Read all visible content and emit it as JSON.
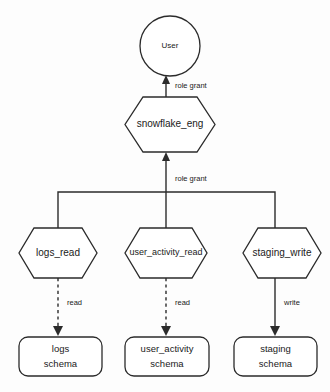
{
  "diagram": {
    "background_color": "#fdfdfd",
    "line_color": "#2b2b2b",
    "text_color": "#1a1a1a",
    "nodes": {
      "user": {
        "label": "User",
        "shape": "circle"
      },
      "snowflake_eng": {
        "label": "snowflake_eng",
        "shape": "hexagon"
      },
      "logs_read": {
        "label": "logs_read",
        "shape": "hexagon"
      },
      "user_activity_read": {
        "label": "user_activity_read",
        "shape": "hexagon"
      },
      "staging_write": {
        "label": "staging_write",
        "shape": "hexagon"
      },
      "logs_schema": {
        "label_line1": "logs",
        "label_line2": "schema",
        "shape": "rounded-rect"
      },
      "user_activity_schema": {
        "label_line1": "user_activity",
        "label_line2": "schema",
        "shape": "rounded-rect"
      },
      "staging_schema": {
        "label_line1": "staging",
        "label_line2": "schema",
        "shape": "rounded-rect"
      }
    },
    "edges": {
      "snowflake_eng_to_user": {
        "label": "role grant",
        "style": "solid"
      },
      "roles_to_snowflake_eng": {
        "label": "role grant",
        "style": "solid"
      },
      "logs_read_to_logs_schema": {
        "label": "read",
        "style": "dashed"
      },
      "user_activity_read_to_user_activity_schema": {
        "label": "read",
        "style": "dashed"
      },
      "staging_write_to_staging_schema": {
        "label": "write",
        "style": "solid"
      }
    }
  }
}
